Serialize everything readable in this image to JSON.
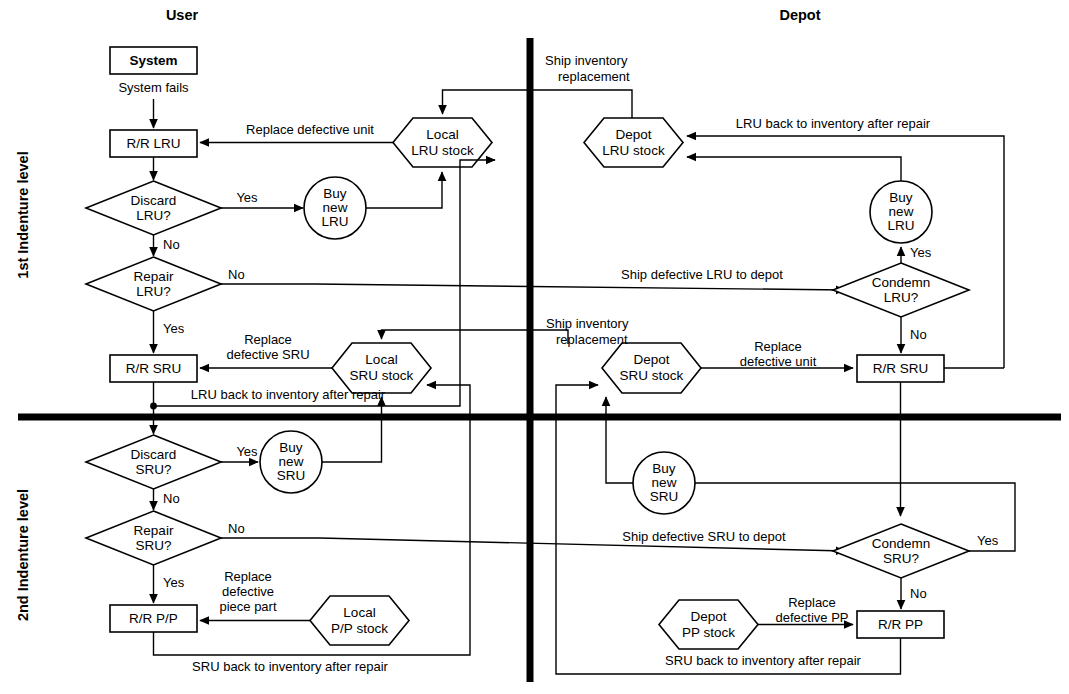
{
  "diagram": {
    "lanes": [
      {
        "id": "user",
        "label": "User"
      },
      {
        "id": "depot",
        "label": "Depot"
      }
    ],
    "levels": [
      {
        "id": "level1",
        "label": "1st Indenture level"
      },
      {
        "id": "level2",
        "label": "2nd Indenture level"
      }
    ],
    "nodes": {
      "system": "System",
      "rr_lru": "R/R LRU",
      "discard_lru_l1": "Discard",
      "discard_lru_l2": "LRU?",
      "buy_new_lru_user_l1": "Buy",
      "buy_new_lru_user_l2": "new",
      "buy_new_lru_user_l3": "LRU",
      "local_lru_stock_l1": "Local",
      "local_lru_stock_l2": "LRU stock",
      "repair_lru_l1": "Repair",
      "repair_lru_l2": "LRU?",
      "rr_sru_user": "R/R SRU",
      "local_sru_stock_l1": "Local",
      "local_sru_stock_l2": "SRU stock",
      "discard_sru_l1": "Discard",
      "discard_sru_l2": "SRU?",
      "buy_new_sru_user_l1": "Buy",
      "buy_new_sru_user_l2": "new",
      "buy_new_sru_user_l3": "SRU",
      "repair_sru_l1": "Repair",
      "repair_sru_l2": "SRU?",
      "rr_pp_user": "R/R P/P",
      "local_pp_stock_l1": "Local",
      "local_pp_stock_l2": "P/P stock",
      "depot_lru_stock_l1": "Depot",
      "depot_lru_stock_l2": "LRU stock",
      "buy_new_lru_depot_l1": "Buy",
      "buy_new_lru_depot_l2": "new",
      "buy_new_lru_depot_l3": "LRU",
      "condemn_lru_l1": "Condemn",
      "condemn_lru_l2": "LRU?",
      "rr_sru_depot": "R/R SRU",
      "depot_sru_stock_l1": "Depot",
      "depot_sru_stock_l2": "SRU stock",
      "buy_new_sru_depot_l1": "Buy",
      "buy_new_sru_depot_l2": "new",
      "buy_new_sru_depot_l3": "SRU",
      "condemn_sru_l1": "Condemn",
      "condemn_sru_l2": "SRU?",
      "rr_pp_depot": "R/R PP",
      "depot_pp_stock_l1": "Depot",
      "depot_pp_stock_l2": "PP stock"
    },
    "edges": {
      "system_fails": "System fails",
      "ship_inventory_replacement_lru_l1": "Ship inventory",
      "ship_inventory_replacement_lru_l2": "replacement",
      "replace_defective_unit_user": "Replace defective unit",
      "yes_discard_lru": "Yes",
      "no_discard_lru": "No",
      "no_repair_lru": "No",
      "yes_repair_lru": "Yes",
      "lru_back_to_inventory_depot": "LRU back to inventory after repair",
      "ship_defective_lru_to_depot": "Ship defective LRU to depot",
      "yes_condemn_lru": "Yes",
      "no_condemn_lru": "No",
      "replace_defective_sru_user_l1": "Replace",
      "replace_defective_sru_user_l2": "defective SRU",
      "ship_inventory_replacement_sru_l1": "Ship inventory",
      "ship_inventory_replacement_sru_l2": "replacement",
      "replace_defective_unit_depot_l1": "Replace",
      "replace_defective_unit_depot_l2": "defective unit",
      "lru_back_to_inventory_user": "LRU back to inventory after repair",
      "yes_discard_sru": "Yes",
      "no_discard_sru": "No",
      "no_repair_sru": "No",
      "yes_repair_sru": "Yes",
      "ship_defective_sru_to_depot": "Ship defective SRU to depot",
      "yes_condemn_sru": "Yes",
      "no_condemn_sru": "No",
      "replace_defective_piece_part_l1": "Replace",
      "replace_defective_piece_part_l2": "defective",
      "replace_defective_piece_part_l3": "piece part",
      "replace_defective_pp_depot_l1": "Replace",
      "replace_defective_pp_depot_l2": "defective PP",
      "sru_back_to_inventory_user": "SRU back to inventory after repair",
      "sru_back_to_inventory_depot": "SRU back to inventory after repair"
    },
    "colors": {
      "stroke": "#000000",
      "fill": "#ffffff",
      "background": "#ffffff"
    }
  }
}
